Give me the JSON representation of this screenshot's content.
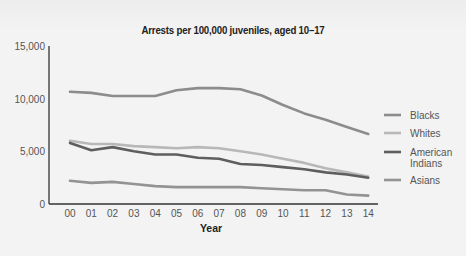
{
  "chart_data": {
    "type": "line",
    "title": "Arrests per 100,000 juveniles, aged 10–17",
    "xlabel": "Year",
    "ylabel": "",
    "x": [
      "00",
      "01",
      "02",
      "03",
      "04",
      "05",
      "06",
      "07",
      "08",
      "09",
      "10",
      "11",
      "12",
      "13",
      "14"
    ],
    "yticks": [
      "0",
      "5,000",
      "10,000",
      "15,000"
    ],
    "ylim": [
      0,
      15000
    ],
    "grid": false,
    "legend_position": "right",
    "series": [
      {
        "name": "Blacks",
        "color": "#8c8c8c",
        "values": [
          10650,
          10550,
          10250,
          10250,
          10250,
          10800,
          11000,
          11000,
          10900,
          10300,
          9400,
          8600,
          8000,
          7300,
          6650
        ]
      },
      {
        "name": "Whites",
        "color": "#b8b8b8",
        "values": [
          6000,
          5700,
          5700,
          5500,
          5400,
          5300,
          5400,
          5300,
          5000,
          4700,
          4300,
          3900,
          3400,
          3000,
          2600
        ]
      },
      {
        "name": "American Indians",
        "color": "#5e5e5e",
        "values": [
          5800,
          5100,
          5400,
          5000,
          4700,
          4700,
          4400,
          4300,
          3800,
          3700,
          3500,
          3300,
          3000,
          2800,
          2500
        ]
      },
      {
        "name": "Asians",
        "color": "#939393",
        "values": [
          2200,
          2000,
          2100,
          1900,
          1700,
          1600,
          1600,
          1600,
          1600,
          1500,
          1400,
          1300,
          1300,
          900,
          800
        ]
      }
    ]
  },
  "legend": [
    {
      "label_lines": [
        "Blacks"
      ]
    },
    {
      "label_lines": [
        "Whites"
      ]
    },
    {
      "label_lines": [
        "American",
        "Indians"
      ]
    },
    {
      "label_lines": [
        "Asians"
      ]
    }
  ]
}
